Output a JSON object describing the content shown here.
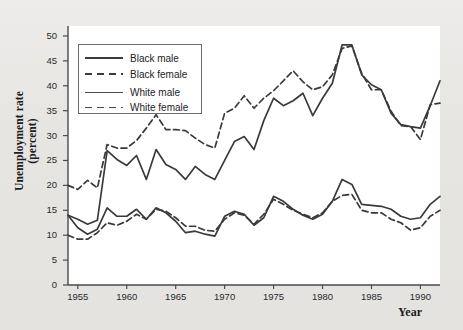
{
  "figure": {
    "background_color": "#e8e7e4",
    "plot_background_color": "#ffffff",
    "line_color": "#3a3a3a"
  },
  "axis": {
    "y_label_line1": "Unemployment rate",
    "y_label_line2": "(percent)",
    "x_label": "Year",
    "y_ticks": [
      "0",
      "5",
      "10",
      "15",
      "20",
      "25",
      "30",
      "35",
      "40",
      "45",
      "50"
    ],
    "x_ticks": [
      "1955",
      "1960",
      "1965",
      "1970",
      "1975",
      "1980",
      "1985",
      "1990"
    ]
  },
  "legend": {
    "items": [
      {
        "label": "Black male",
        "style": "solid"
      },
      {
        "label": "Black female",
        "style": "dashed"
      },
      {
        "label": "White male",
        "style": "solid"
      },
      {
        "label": "White female",
        "style": "dashed"
      }
    ]
  },
  "caption": {
    "text": ""
  },
  "chart_data": {
    "type": "line",
    "title": "",
    "xlabel": "Year",
    "ylabel": "Unemployment rate (percent)",
    "xlim": [
      1954,
      1992
    ],
    "ylim": [
      0,
      52
    ],
    "yticks": [
      0,
      5,
      10,
      15,
      20,
      25,
      30,
      35,
      40,
      45,
      50
    ],
    "xticks": [
      1955,
      1960,
      1965,
      1970,
      1975,
      1980,
      1985,
      1990
    ],
    "grid": false,
    "legend_position": "upper-left",
    "x": [
      1954,
      1955,
      1956,
      1957,
      1958,
      1959,
      1960,
      1961,
      1962,
      1963,
      1964,
      1965,
      1966,
      1967,
      1968,
      1969,
      1970,
      1971,
      1972,
      1973,
      1974,
      1975,
      1976,
      1977,
      1978,
      1979,
      1980,
      1981,
      1982,
      1983,
      1984,
      1985,
      1986,
      1987,
      1988,
      1989,
      1990,
      1991,
      1992
    ],
    "series": [
      {
        "name": "Black male",
        "style": "solid",
        "values": [
          14.0,
          13.2,
          12.2,
          13.0,
          27.0,
          25.2,
          24.0,
          26.0,
          21.2,
          27.2,
          24.2,
          23.2,
          21.2,
          23.8,
          22.2,
          21.2,
          25.0,
          28.8,
          29.8,
          27.2,
          33.0,
          37.5,
          36.0,
          37.0,
          38.5,
          34.0,
          37.5,
          40.5,
          48.2,
          48.2,
          42.2,
          40.2,
          39.2,
          34.5,
          32.2,
          31.8,
          31.5,
          36.0,
          41.0
        ]
      },
      {
        "name": "Black female",
        "style": "dashed",
        "values": [
          20.0,
          19.2,
          21.0,
          19.5,
          28.2,
          27.5,
          27.5,
          29.0,
          31.5,
          34.2,
          31.2,
          31.2,
          31.0,
          29.5,
          28.2,
          27.5,
          34.5,
          35.5,
          38.0,
          35.5,
          37.5,
          39.0,
          41.0,
          43.0,
          40.8,
          39.2,
          39.8,
          42.2,
          47.5,
          48.0,
          42.5,
          39.2,
          39.2,
          34.9,
          32.0,
          31.8,
          29.2,
          36.2,
          36.5
        ]
      },
      {
        "name": "White male",
        "style": "solid",
        "values": [
          14.0,
          11.5,
          10.2,
          11.2,
          15.5,
          13.8,
          13.8,
          15.2,
          13.2,
          15.5,
          14.5,
          12.8,
          10.5,
          10.8,
          10.2,
          9.8,
          13.8,
          14.8,
          14.2,
          12.0,
          13.5,
          17.8,
          16.8,
          15.2,
          14.0,
          13.2,
          14.2,
          16.8,
          21.2,
          20.2,
          16.2,
          16.0,
          15.8,
          15.2,
          13.8,
          13.2,
          13.5,
          16.2,
          17.8
        ]
      },
      {
        "name": "White female",
        "style": "dashed",
        "values": [
          10.0,
          9.2,
          9.2,
          10.5,
          12.5,
          12.0,
          12.8,
          14.2,
          13.2,
          15.2,
          14.8,
          13.5,
          11.8,
          11.8,
          11.0,
          10.8,
          13.2,
          14.5,
          14.0,
          12.2,
          14.2,
          17.2,
          16.2,
          15.0,
          14.2,
          13.5,
          14.5,
          16.8,
          18.0,
          18.2,
          15.0,
          14.5,
          14.5,
          13.2,
          12.5,
          11.0,
          11.5,
          13.8,
          15.0
        ]
      }
    ]
  }
}
